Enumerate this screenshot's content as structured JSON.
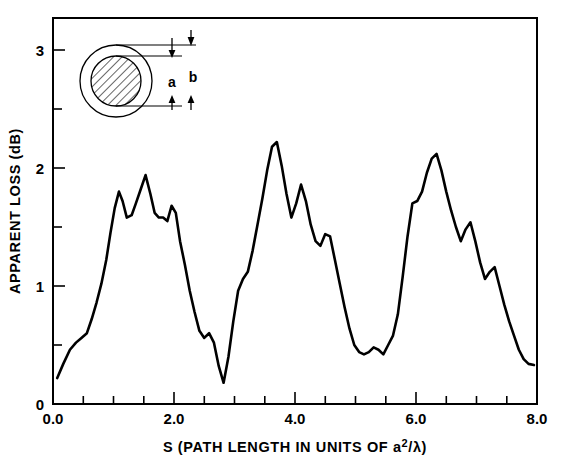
{
  "chart_data": {
    "type": "line",
    "title": "",
    "xlabel": "S (PATH LENGTH IN UNITS OF a²/λ)",
    "ylabel": "APPARENT LOSS (dB)",
    "xlim": [
      0.0,
      8.0
    ],
    "ylim": [
      0.0,
      3.2
    ],
    "grid": false,
    "legend": "none",
    "x_major_ticks": [
      "0.0",
      "2.0",
      "4.0",
      "6.0",
      "8.0"
    ],
    "x_major_values": [
      0.0,
      2.0,
      4.0,
      6.0,
      8.0
    ],
    "x_minor_values": [
      0.5,
      1.0,
      1.5,
      2.5,
      3.0,
      3.5,
      4.5,
      5.0,
      5.5,
      6.5,
      7.0,
      7.5
    ],
    "y_major_ticks": [
      "0",
      "1",
      "2",
      "3"
    ],
    "y_major_values": [
      0,
      1,
      2,
      3
    ],
    "y_minor_values": [
      0.5,
      1.5,
      2.5
    ],
    "series": [
      {
        "name": "apparent loss",
        "x": [
          0.07,
          0.17,
          0.28,
          0.38,
          0.47,
          0.56,
          0.64,
          0.72,
          0.8,
          0.88,
          0.95,
          1.02,
          1.09,
          1.15,
          1.22,
          1.3,
          1.37,
          1.45,
          1.53,
          1.61,
          1.68,
          1.75,
          1.82,
          1.89,
          1.96,
          2.03,
          2.1,
          2.18,
          2.26,
          2.34,
          2.42,
          2.5,
          2.58,
          2.66,
          2.74,
          2.82,
          2.9,
          2.98,
          3.06,
          3.14,
          3.22,
          3.3,
          3.38,
          3.46,
          3.54,
          3.62,
          3.7,
          3.78,
          3.86,
          3.94,
          4.02,
          4.1,
          4.18,
          4.26,
          4.34,
          4.42,
          4.5,
          4.58,
          4.66,
          4.74,
          4.82,
          4.9,
          4.98,
          5.06,
          5.14,
          5.22,
          5.3,
          5.38,
          5.46,
          5.54,
          5.62,
          5.7,
          5.78,
          5.86,
          5.94,
          6.02,
          6.1,
          6.18,
          6.26,
          6.34,
          6.42,
          6.5,
          6.58,
          6.66,
          6.74,
          6.82,
          6.9,
          6.98,
          7.06,
          7.14,
          7.22,
          7.3,
          7.38,
          7.46,
          7.54,
          7.62,
          7.7,
          7.78,
          7.86,
          7.95
        ],
        "y": [
          0.22,
          0.34,
          0.46,
          0.52,
          0.56,
          0.6,
          0.72,
          0.86,
          1.02,
          1.22,
          1.45,
          1.66,
          1.8,
          1.72,
          1.58,
          1.6,
          1.7,
          1.82,
          1.94,
          1.78,
          1.62,
          1.58,
          1.58,
          1.55,
          1.68,
          1.62,
          1.38,
          1.18,
          0.96,
          0.78,
          0.62,
          0.56,
          0.6,
          0.52,
          0.32,
          0.18,
          0.4,
          0.7,
          0.96,
          1.06,
          1.12,
          1.3,
          1.52,
          1.74,
          1.98,
          2.18,
          2.22,
          2.02,
          1.78,
          1.58,
          1.7,
          1.86,
          1.72,
          1.52,
          1.38,
          1.34,
          1.44,
          1.42,
          1.22,
          1.02,
          0.82,
          0.64,
          0.5,
          0.44,
          0.42,
          0.44,
          0.48,
          0.46,
          0.42,
          0.5,
          0.58,
          0.76,
          1.08,
          1.42,
          1.7,
          1.72,
          1.8,
          1.96,
          2.08,
          2.12,
          1.98,
          1.8,
          1.64,
          1.5,
          1.38,
          1.48,
          1.54,
          1.38,
          1.2,
          1.06,
          1.12,
          1.16,
          1.0,
          0.84,
          0.7,
          0.58,
          0.46,
          0.38,
          0.34,
          0.33
        ]
      }
    ],
    "annotations": {
      "inset": {
        "label_inner": "a",
        "label_outer": "b",
        "description": "cross-section of fiber: outer cladding circle with hatched inner core circle, dimension arrows marking core diameter a and cladding diameter b"
      }
    }
  },
  "inset": {
    "label_a": "a",
    "label_b": "b"
  }
}
